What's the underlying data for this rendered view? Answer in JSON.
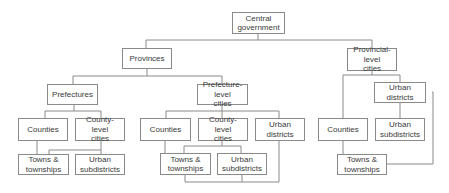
{
  "diagram": {
    "type": "org-chart",
    "nodes": [
      {
        "id": "central",
        "label": "Central\ngovernment"
      },
      {
        "id": "provinces",
        "label": "Provinces"
      },
      {
        "id": "provincial-cities",
        "label": "Provincial-level\ncities"
      },
      {
        "id": "prefectures",
        "label": "Prefectures"
      },
      {
        "id": "prefecture-cities",
        "label": "Prefecture-level\ncities"
      },
      {
        "id": "pref-counties",
        "label": "Counties"
      },
      {
        "id": "pref-county-cities",
        "label": "County-level\ncities"
      },
      {
        "id": "pref-towns",
        "label": "Towns &\ntownships"
      },
      {
        "id": "pref-urban-sub",
        "label": "Urban\nsubdistricts"
      },
      {
        "id": "pc-counties",
        "label": "Counties"
      },
      {
        "id": "pc-county-cities",
        "label": "County-level\ncities"
      },
      {
        "id": "pc-urban-districts",
        "label": "Urban districts"
      },
      {
        "id": "pc-towns",
        "label": "Towns &\ntownships"
      },
      {
        "id": "pc-urban-sub",
        "label": "Urban\nsubdistricts"
      },
      {
        "id": "prov-urban-districts",
        "label": "Urban districts"
      },
      {
        "id": "prov-counties",
        "label": "Counties"
      },
      {
        "id": "prov-urban-sub",
        "label": "Urban\nsubdistricts"
      },
      {
        "id": "prov-towns",
        "label": "Towns &\ntownships"
      }
    ],
    "edges": [
      [
        "central",
        "provinces"
      ],
      [
        "central",
        "provincial-cities"
      ],
      [
        "provinces",
        "prefectures"
      ],
      [
        "provinces",
        "prefecture-cities"
      ],
      [
        "prefectures",
        "pref-counties"
      ],
      [
        "prefectures",
        "pref-county-cities"
      ],
      [
        "pref-counties",
        "pref-towns"
      ],
      [
        "pref-county-cities",
        "pref-towns"
      ],
      [
        "pref-county-cities",
        "pref-urban-sub"
      ],
      [
        "prefecture-cities",
        "pc-counties"
      ],
      [
        "prefecture-cities",
        "pc-county-cities"
      ],
      [
        "prefecture-cities",
        "pc-urban-districts"
      ],
      [
        "pc-counties",
        "pc-towns"
      ],
      [
        "pc-county-cities",
        "pc-towns"
      ],
      [
        "pc-county-cities",
        "pc-urban-sub"
      ],
      [
        "pc-urban-districts",
        "pc-towns"
      ],
      [
        "pc-urban-districts",
        "pc-urban-sub"
      ],
      [
        "provincial-cities",
        "prov-counties"
      ],
      [
        "provincial-cities",
        "prov-urban-districts"
      ],
      [
        "prov-urban-districts",
        "prov-urban-sub"
      ],
      [
        "prov-urban-districts",
        "prov-towns"
      ],
      [
        "prov-counties",
        "prov-towns"
      ]
    ]
  }
}
